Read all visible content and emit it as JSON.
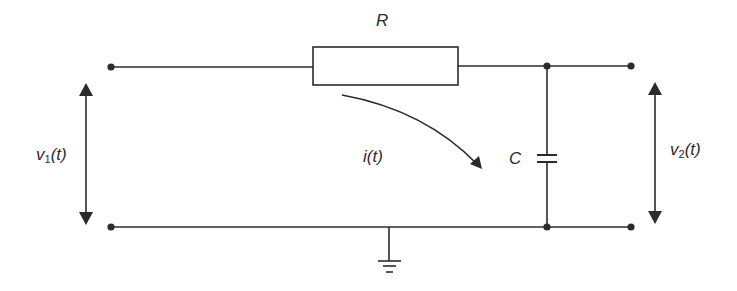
{
  "diagram": {
    "type": "RC low-pass circuit",
    "colors": {
      "line": "#2b2b2b",
      "background": "#ffffff"
    },
    "labels": {
      "resistor": "R",
      "capacitor": "C",
      "current": "i(t)",
      "input_voltage": {
        "symbol": "v",
        "subscript": "1",
        "arg": "(t)"
      },
      "output_voltage": {
        "symbol": "v",
        "subscript": "2",
        "arg": "(t)"
      }
    },
    "components": [
      {
        "id": "resistor",
        "symbol": "rectangle-resistor",
        "label": "R"
      },
      {
        "id": "capacitor",
        "symbol": "capacitor",
        "label": "C"
      },
      {
        "id": "ground",
        "symbol": "ground-icon"
      }
    ],
    "terminals": [
      "input-top",
      "input-bottom",
      "output-top",
      "output-bottom"
    ],
    "arrows": [
      {
        "id": "v1-arrow",
        "direction": "bidirectional-vertical"
      },
      {
        "id": "v2-arrow",
        "direction": "bidirectional-vertical"
      },
      {
        "id": "current-arrow",
        "direction": "curved-clockwise"
      }
    ]
  }
}
